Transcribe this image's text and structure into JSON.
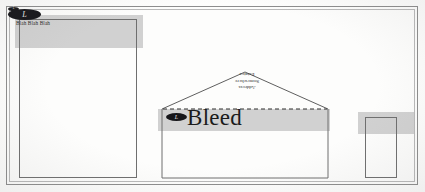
{
  "frame": {
    "outer_color": "#8d8d8d",
    "inner_color": "#b9b9b9"
  },
  "bleed": {
    "band_color": "#c9c9c9",
    "letterhead_label": "letterhead bleed band",
    "envelope_label": "envelope bleed band",
    "card_label": "business card bleed band"
  },
  "logo": {
    "glyph": "L",
    "shape": "ellipse",
    "color": "#16161a"
  },
  "letterhead": {
    "name": "letterhead",
    "tagline": "Blah Blah Blah"
  },
  "envelope": {
    "name": "envelope",
    "bleed_label": "Bleed",
    "address_lines": [
      "Address",
      "Somewhere",
      "Estates"
    ],
    "flap_line_style": "dashed"
  },
  "business_card": {
    "name": "business card"
  }
}
